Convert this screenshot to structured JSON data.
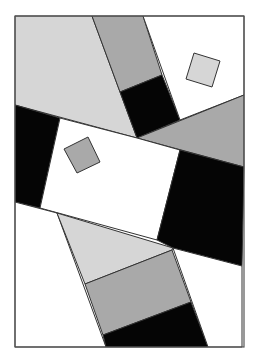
{
  "artwork": {
    "description": "Abstract geometric composition of grayscale polygons inside a rectangular frame",
    "frame": {
      "x1": 15,
      "y1": 16,
      "x2": 244,
      "y2": 347
    },
    "colors": {
      "background": "#ffffff",
      "light_gray": "#d6d6d6",
      "mid_gray": "#a9a9a9",
      "black": "#050505",
      "white": "#ffffff",
      "stroke": "#333333"
    },
    "shapes": [
      {
        "name": "light-gray-top-left-quad",
        "fill": "light_gray",
        "points": "15,16 92,16 137,138 15,105"
      },
      {
        "name": "mid-gray-top-band",
        "fill": "mid_gray",
        "points": "92,16 143,16 162,75 120,92"
      },
      {
        "name": "black-top-band-block",
        "fill": "black",
        "points": "120,92 162,75 180,120 137,138"
      },
      {
        "name": "white-top-right-area",
        "fill": "white",
        "points": "143,16 244,16 244,95 180,120"
      },
      {
        "name": "light-gray-small-square-top-right",
        "fill": "light_gray",
        "points": "194,53 220,61 212,87 186,79"
      },
      {
        "name": "mid-gray-right-triangle",
        "fill": "mid_gray",
        "points": "137,138 244,95 244,167"
      },
      {
        "name": "black-left-wedge",
        "fill": "black",
        "points": "15,105 60,118 40,208 15,202"
      },
      {
        "name": "white-center-rectangle",
        "fill": "white",
        "points": "60,118 137,138 180,150 157,240 40,208"
      },
      {
        "name": "mid-gray-small-square-center",
        "fill": "mid_gray",
        "points": "64,149 88,137 100,162 77,173"
      },
      {
        "name": "black-right-block",
        "fill": "black",
        "points": "180,150 244,167 242,266 173,248 157,240"
      },
      {
        "name": "white-bottom-left-area",
        "fill": "white",
        "points": "15,202 57,213 106,347 15,347"
      },
      {
        "name": "light-gray-bottom-quad",
        "fill": "light_gray",
        "points": "57,213 173,248 172,250 85,284"
      },
      {
        "name": "mid-gray-bottom-quad",
        "fill": "mid_gray",
        "points": "85,284 172,250 191,302 103,335"
      },
      {
        "name": "black-bottom-quad",
        "fill": "black",
        "points": "103,335 191,302 208,347 106,347"
      },
      {
        "name": "white-bottom-right-area",
        "fill": "white",
        "points": "173,248 242,266 242,347 208,347"
      }
    ]
  }
}
